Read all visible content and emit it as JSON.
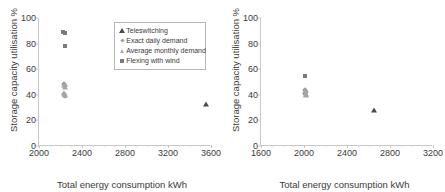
{
  "figure": {
    "panels": [
      "left",
      "right"
    ]
  },
  "chart_data": [
    {
      "panel": "left",
      "type": "scatter",
      "title": "",
      "xlabel": "Total energy consumption   kWh",
      "ylabel": "Storage capacity utilisation  %",
      "xlim": [
        2000,
        3600
      ],
      "ylim": [
        0,
        100
      ],
      "xticks": [
        2000,
        2400,
        2800,
        3200,
        3600
      ],
      "yticks": [
        0,
        20,
        40,
        60,
        80,
        100
      ],
      "grid": false,
      "legend_position": "upper-right-inside",
      "series": [
        {
          "name": "Teleswitching",
          "marker": "triangle",
          "color": "#4a4a4a",
          "points": [
            [
              3550,
              32.5
            ]
          ]
        },
        {
          "name": "Exact daily demand",
          "marker": "diamond",
          "color": "#9a9a9a",
          "points": [
            [
              2230,
              48.5
            ],
            [
              2240,
              47.0
            ],
            [
              2235,
              40.5
            ],
            [
              2245,
              39.0
            ]
          ]
        },
        {
          "name": "Average monthly demand",
          "marker": "triangle-light",
          "color": "#a6a6a6",
          "points": [
            [
              2232,
              47.8
            ],
            [
              2238,
              46.2
            ],
            [
              2236,
              41.5
            ],
            [
              2242,
              39.8
            ]
          ]
        },
        {
          "name": "Flexing with wind",
          "marker": "square",
          "color": "#7b7b7b",
          "points": [
            [
              2225,
              89.0
            ],
            [
              2240,
              88.0
            ],
            [
              2245,
              78.0
            ]
          ]
        }
      ]
    },
    {
      "panel": "right",
      "type": "scatter",
      "title": "",
      "xlabel": "Total energy consumption   kWh",
      "ylabel": "Storage capacity utilisation  %",
      "xlim": [
        1600,
        3200
      ],
      "ylim": [
        0,
        100
      ],
      "xticks": [
        1600,
        2000,
        2400,
        2800,
        3200
      ],
      "yticks": [
        0,
        20,
        40,
        60,
        80,
        100
      ],
      "grid": false,
      "legend_position": "none",
      "series": [
        {
          "name": "Teleswitching",
          "marker": "triangle",
          "color": "#4a4a4a",
          "points": [
            [
              2650,
              28.0
            ]
          ]
        },
        {
          "name": "Exact daily demand",
          "marker": "diamond",
          "color": "#9a9a9a",
          "points": [
            [
              2010,
              44.0
            ],
            [
              2015,
              42.0
            ],
            [
              2008,
              40.5
            ]
          ]
        },
        {
          "name": "Average monthly demand",
          "marker": "triangle-light",
          "color": "#a6a6a6",
          "points": [
            [
              2012,
              43.0
            ],
            [
              2018,
              41.0
            ],
            [
              2014,
              39.5
            ]
          ]
        },
        {
          "name": "Flexing with wind",
          "marker": "square",
          "color": "#7b7b7b",
          "points": [
            [
              2010,
              55.0
            ]
          ]
        }
      ]
    }
  ],
  "legend": {
    "items": [
      {
        "label": "Teleswitching",
        "marker": "triangle"
      },
      {
        "label": "Exact daily demand",
        "marker": "diamond"
      },
      {
        "label": "Average monthly demand",
        "marker": "triangle-light"
      },
      {
        "label": "Flexing with wind",
        "marker": "square"
      }
    ]
  }
}
